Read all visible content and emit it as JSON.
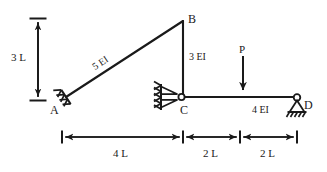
{
  "figure": {
    "type": "structural-frame-diagram",
    "stroke_color": "#1a1a1a",
    "background_color": "#ffffff"
  },
  "nodes": {
    "a": {
      "label": "A",
      "x": 66,
      "y": 97,
      "support": "fixed-inclined"
    },
    "b": {
      "label": "B",
      "x": 183,
      "y": 21,
      "support": "none"
    },
    "c": {
      "label": "C",
      "x": 183,
      "y": 97,
      "support": "pin-on-wall"
    },
    "d": {
      "label": "D",
      "x": 297,
      "y": 97,
      "support": "pinned"
    }
  },
  "members": [
    {
      "name": "AB",
      "stiffness_label": "5 EI",
      "from": "A",
      "to": "B"
    },
    {
      "name": "BC",
      "stiffness_label": "3 EI",
      "from": "B",
      "to": "C"
    },
    {
      "name": "CD",
      "stiffness_label": "4 EI",
      "from": "C",
      "to": "D"
    }
  ],
  "stiffness_labels": {
    "ab": "5 EI",
    "bc": "3 EI",
    "cd": "4 EI"
  },
  "load": {
    "label": "P",
    "direction": "down",
    "x": 243,
    "arrow_top_y": 56,
    "arrow_bottom_y": 95
  },
  "vertical_dimension": {
    "label": "3 L",
    "x": 38,
    "top_y": 18,
    "bottom_y": 100
  },
  "horizontal_dimensions": {
    "baseline_y": 137,
    "segments": [
      {
        "label": "4 L",
        "start_x": 62,
        "end_x": 183
      },
      {
        "label": "2 L",
        "start_x": 183,
        "end_x": 240
      },
      {
        "label": "2 L",
        "start_x": 240,
        "end_x": 297
      }
    ]
  },
  "supports": {
    "a": {
      "type": "fixed",
      "hatch_count": 3
    },
    "c": {
      "type": "pin-roller-on-wall",
      "hatch_count": 3,
      "triangles": 2
    },
    "d": {
      "type": "pinned",
      "hatch_count": 5
    }
  }
}
